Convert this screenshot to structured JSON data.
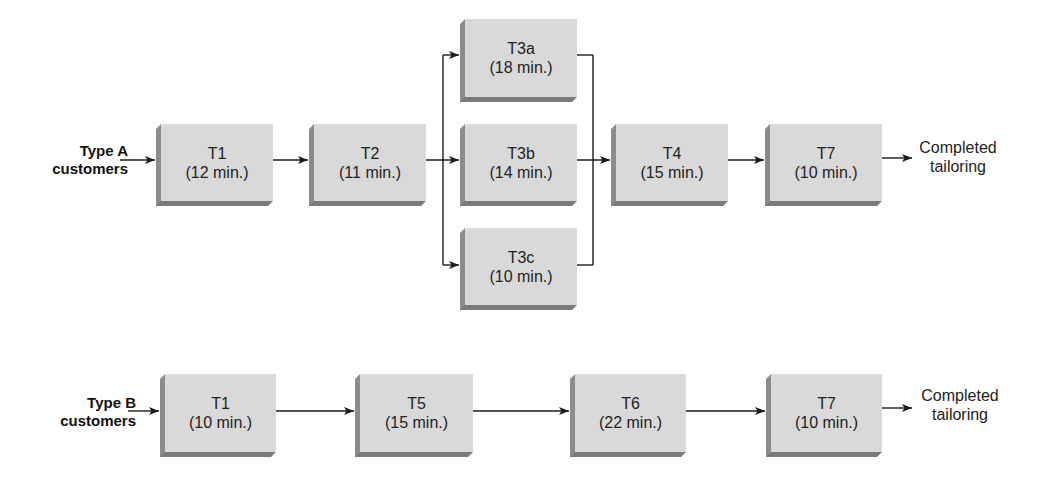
{
  "diagram": {
    "type": "process-flow",
    "flows": [
      {
        "id": "type_a",
        "source_label_line1": "Type A",
        "source_label_line2": "customers",
        "sink_label_line1": "Completed",
        "sink_label_line2": "tailoring",
        "tasks": [
          {
            "name": "T1",
            "time": "(12 min.)"
          },
          {
            "name": "T2",
            "time": "(11 min.)"
          },
          {
            "name": "T3a",
            "time": "(18 min.)"
          },
          {
            "name": "T3b",
            "time": "(14 min.)"
          },
          {
            "name": "T3c",
            "time": "(10 min.)"
          },
          {
            "name": "T4",
            "time": "(15 min.)"
          },
          {
            "name": "T7",
            "time": "(10 min.)"
          }
        ],
        "edges": [
          [
            "Type A customers",
            "T1"
          ],
          [
            "T1",
            "T2"
          ],
          [
            "T2",
            "T3a"
          ],
          [
            "T2",
            "T3b"
          ],
          [
            "T2",
            "T3c"
          ],
          [
            "T3a",
            "T4"
          ],
          [
            "T3b",
            "T4"
          ],
          [
            "T3c",
            "T4"
          ],
          [
            "T4",
            "T7"
          ],
          [
            "T7",
            "Completed tailoring"
          ]
        ]
      },
      {
        "id": "type_b",
        "source_label_line1": "Type B",
        "source_label_line2": "customers",
        "sink_label_line1": "Completed",
        "sink_label_line2": "tailoring",
        "tasks": [
          {
            "name": "T1",
            "time": "(10 min.)"
          },
          {
            "name": "T5",
            "time": "(15 min.)"
          },
          {
            "name": "T6",
            "time": "(22 min.)"
          },
          {
            "name": "T7",
            "time": "(10 min.)"
          }
        ],
        "edges": [
          [
            "Type B customers",
            "T1"
          ],
          [
            "T1",
            "T5"
          ],
          [
            "T5",
            "T6"
          ],
          [
            "T6",
            "T7"
          ],
          [
            "T7",
            "Completed tailoring"
          ]
        ]
      }
    ]
  },
  "colors": {
    "box_fill": "#d9d9d9",
    "box_shadow": "#7a7a7a",
    "line": "#1a1a1a"
  }
}
